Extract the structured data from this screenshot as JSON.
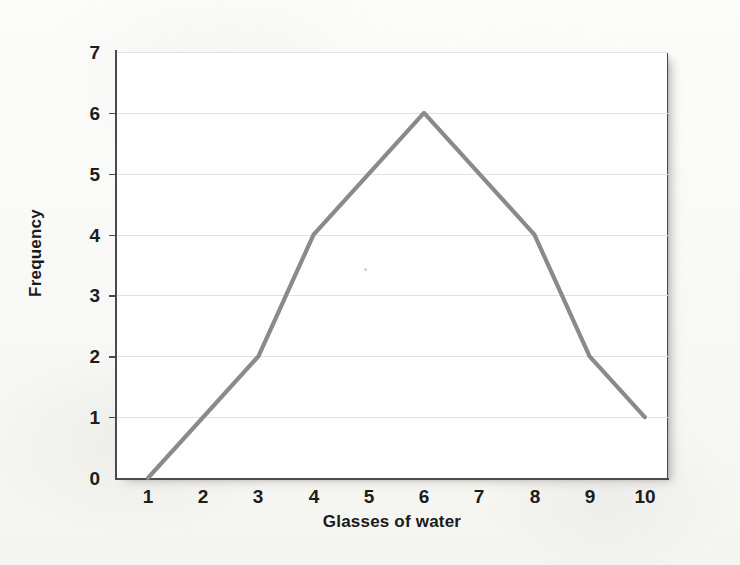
{
  "figure": {
    "kind": "scanned-textbook-figure",
    "line_color": "#8a8a8a",
    "axis_color": "#4a4a4a",
    "gridline_color": "#e2e2e2",
    "background_color": "#f8f8f6",
    "plot_background_color": "#ffffff"
  },
  "chart_data": {
    "type": "line",
    "title": "",
    "xlabel": "Glasses of water",
    "ylabel": "Frequency",
    "x": [
      1,
      3,
      4,
      6,
      8,
      9,
      10
    ],
    "values": [
      0,
      2,
      4,
      6,
      4,
      2,
      1
    ],
    "points": [
      {
        "x": 1,
        "y": 0
      },
      {
        "x": 3,
        "y": 2
      },
      {
        "x": 4,
        "y": 4
      },
      {
        "x": 6,
        "y": 6
      },
      {
        "x": 8,
        "y": 4
      },
      {
        "x": 9,
        "y": 2
      },
      {
        "x": 10,
        "y": 1
      }
    ],
    "xlim": [
      0.6,
      10.4
    ],
    "ylim": [
      0,
      7
    ],
    "xticks": [
      1,
      2,
      3,
      4,
      5,
      6,
      7,
      8,
      9,
      10
    ],
    "yticks": [
      0,
      1,
      2,
      3,
      4,
      5,
      6,
      7
    ],
    "xtick_labels": [
      "1",
      "2",
      "3",
      "4",
      "5",
      "6",
      "7",
      "8",
      "9",
      "10"
    ],
    "ytick_labels": [
      "0",
      "1",
      "2",
      "3",
      "4",
      "5",
      "6",
      "7"
    ],
    "grid": "horizontal",
    "legend": null,
    "series": [
      {
        "name": "Frequency",
        "color": "#8a8a8a",
        "values": [
          0,
          2,
          4,
          6,
          4,
          2,
          1
        ]
      }
    ]
  }
}
